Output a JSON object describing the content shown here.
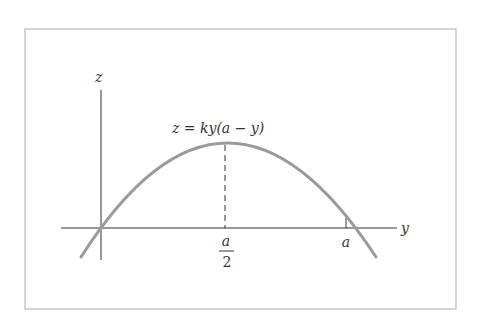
{
  "diagram": {
    "equation_label": "z = ky(a − y)",
    "axes": {
      "vertical_label": "z",
      "horizontal_label": "y"
    },
    "ticks": {
      "midpoint_numerator": "a",
      "midpoint_denominator": "2",
      "root_label": "a"
    },
    "colors": {
      "curve": "#9a9a9a",
      "axes": "#333333",
      "frame": "#bbbbbb",
      "background": "#ffffff"
    }
  }
}
